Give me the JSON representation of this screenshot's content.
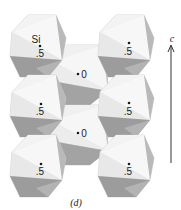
{
  "figure": {
    "caption": "(d)",
    "axis_label": "c",
    "colors": {
      "face_light": "#f1f1f1",
      "face_mid": "#d6d6d6",
      "face_dark": "#a9a9a9",
      "face_darker": "#8e8e8e",
      "edge": "#bdbdbd",
      "ink": "#1a1a1a"
    }
  },
  "octahedra": [
    {
      "id": "left-top",
      "column": "left",
      "label_top": "Si",
      "label": ".5"
    },
    {
      "id": "left-mid",
      "column": "left",
      "label": ".5"
    },
    {
      "id": "left-bottom",
      "column": "left",
      "label": ".5"
    },
    {
      "id": "middle-top",
      "column": "middle",
      "label": "0"
    },
    {
      "id": "middle-bottom",
      "column": "middle",
      "label": "0"
    },
    {
      "id": "right-top",
      "column": "right",
      "label": ".5"
    },
    {
      "id": "right-mid",
      "column": "right",
      "label": ".5"
    },
    {
      "id": "right-bottom",
      "column": "right",
      "label": ".5"
    }
  ]
}
